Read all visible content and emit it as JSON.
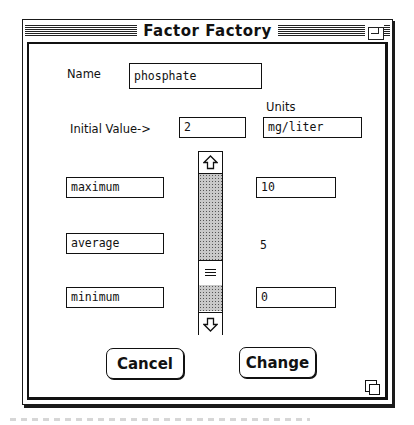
{
  "window": {
    "title": "Factor Factory",
    "zoom_box_icon": "zoom-box-icon",
    "grow_box_icon": "resize-grow-icon"
  },
  "form": {
    "name_label": "Name",
    "name_value": "phosphate",
    "units_label": "Units",
    "initial_value_label": "Initial Value->",
    "initial_value": "2",
    "units_value": "mg/liter",
    "maximum_label_field": "maximum",
    "maximum_value": "10",
    "average_label_field": "average",
    "average_value": "5",
    "minimum_label_field": "minimum",
    "minimum_value": "0"
  },
  "scrollbar": {
    "up_icon": "arrow-up-icon",
    "down_icon": "arrow-down-icon",
    "thumb_icon": "scroll-thumb-grip-icon"
  },
  "buttons": {
    "cancel": "Cancel",
    "change": "Change"
  }
}
